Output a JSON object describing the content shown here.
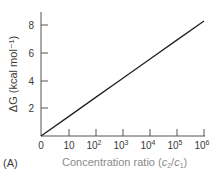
{
  "chart_data": {
    "type": "line",
    "title": "",
    "panel_label": "(A)",
    "xlabel": "Concentration ratio (c2/c1)",
    "xlabel_parts": {
      "main": "Concentration ratio (",
      "c": "c",
      "sub2": "2",
      "slash": "/",
      "sub1": "1",
      "close": ")"
    },
    "ylabel": "ΔG (kcal mol⁻¹)",
    "x_scale": "log",
    "x_ticks": [
      "0",
      "10",
      "10²",
      "10³",
      "10⁴",
      "10⁵",
      "10⁶"
    ],
    "x_tick_base": [
      "0",
      "10",
      "10",
      "10",
      "10",
      "10",
      "10"
    ],
    "x_tick_exp": [
      "",
      "",
      "2",
      "3",
      "4",
      "5",
      "6"
    ],
    "y_ticks": [
      "2",
      "4",
      "6",
      "8"
    ],
    "ylim": [
      0,
      8.9
    ],
    "grid": false,
    "legend": null,
    "series": [
      {
        "name": "ΔG",
        "x": [
          1,
          10,
          100,
          1000,
          10000,
          100000,
          1000000
        ],
        "values": [
          0,
          1.36,
          2.73,
          4.09,
          5.46,
          6.82,
          8.18
        ]
      }
    ]
  }
}
